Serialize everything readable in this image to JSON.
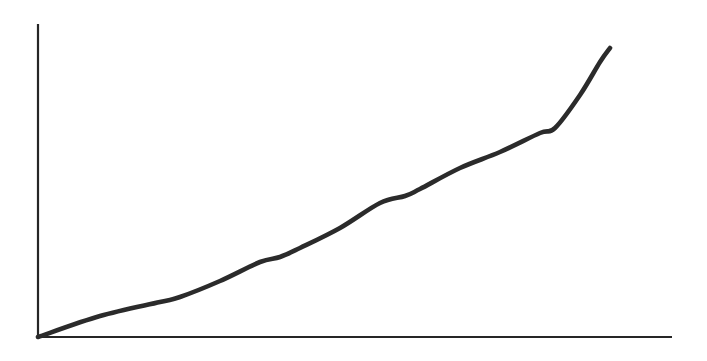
{
  "figure": {
    "kind": "line-graph",
    "background_color": "#ffffff",
    "width": 707,
    "height": 361,
    "axis_color": "#262626",
    "curve_color": "#2b2b2b",
    "axis_stroke_width": 2.2,
    "curve_stroke_width": 4.6,
    "title": "",
    "caption": ""
  },
  "axes": {
    "origin": {
      "x": 38,
      "y": 337
    },
    "y_axis": {
      "x": 38,
      "y_top": 24,
      "y_bottom": 337
    },
    "x_axis": {
      "y": 337,
      "x_left": 38,
      "x_right": 672
    },
    "x_label": "",
    "y_label": "",
    "x_ticks": [],
    "y_ticks": [],
    "arrowheads": false,
    "grid": false
  },
  "chart_data": {
    "type": "line",
    "title": "",
    "xlabel": "",
    "ylabel": "",
    "grid": false,
    "legend": [],
    "legend_position": "none",
    "xlim": [
      0,
      100
    ],
    "ylim": [
      0,
      100
    ],
    "xtick_labels": [],
    "ytick_labels": [],
    "annotations": [],
    "series": [
      {
        "name": "curve",
        "color": "#2b2b2b",
        "x": [
          0,
          9.8,
          19.2,
          22.4,
          28.7,
          35.0,
          38.2,
          41.3,
          47.6,
          53.9,
          57.9,
          60.3,
          66.6,
          72.9,
          79.2,
          81.5,
          85.5,
          88.6,
          90.2
        ],
        "y": [
          0,
          6.7,
          11.2,
          12.8,
          17.9,
          24.0,
          25.6,
          28.4,
          34.8,
          42.8,
          45.0,
          47.3,
          54.0,
          59.1,
          65.2,
          66.8,
          77.3,
          87.9,
          92.3
        ]
      }
    ],
    "pixel_points": [
      {
        "x": 38,
        "y": 337
      },
      {
        "x": 100,
        "y": 316
      },
      {
        "x": 160,
        "y": 302
      },
      {
        "x": 180,
        "y": 297
      },
      {
        "x": 220,
        "y": 281
      },
      {
        "x": 260,
        "y": 262
      },
      {
        "x": 280,
        "y": 257
      },
      {
        "x": 300,
        "y": 248
      },
      {
        "x": 340,
        "y": 228
      },
      {
        "x": 380,
        "y": 203
      },
      {
        "x": 405,
        "y": 196
      },
      {
        "x": 420,
        "y": 189
      },
      {
        "x": 460,
        "y": 168
      },
      {
        "x": 500,
        "y": 152
      },
      {
        "x": 540,
        "y": 133
      },
      {
        "x": 555,
        "y": 128
      },
      {
        "x": 580,
        "y": 95
      },
      {
        "x": 600,
        "y": 62
      },
      {
        "x": 610,
        "y": 48
      }
    ]
  }
}
